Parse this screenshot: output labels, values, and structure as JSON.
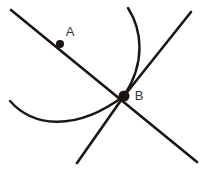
{
  "figure": {
    "title": "Intersecting lines and arcs at point B",
    "background_color": "#ffffff",
    "stroke_color": "#1a1512",
    "label_color": "#3a3532",
    "width": 204,
    "height": 170,
    "points": [
      {
        "id": "A",
        "label": "A",
        "x": 60,
        "y": 44,
        "label_x": 70,
        "label_y": 33,
        "radius": 4
      },
      {
        "id": "B",
        "label": "B",
        "x": 124,
        "y": 96,
        "label_x": 139,
        "label_y": 97,
        "radius": 5.5
      }
    ],
    "lines": [
      {
        "id": "line-ab-extended",
        "name": "line through A and B",
        "d": "M 11 10 L 197 162"
      },
      {
        "id": "line-b-upper-right",
        "name": "ray from B to upper right",
        "d": "M 124 96 L 191 12"
      },
      {
        "id": "line-b-lower-left",
        "name": "ray from B to lower left",
        "d": "M 124 96 L 77 163"
      }
    ],
    "arcs": [
      {
        "id": "arc-top",
        "name": "arc from top curving into B",
        "d": "M 128 8 C 142 30, 146 62, 124 96"
      },
      {
        "id": "arc-left",
        "name": "arc from left sweeping into B",
        "d": "M 10 101 C 32 126, 74 133, 124 96"
      }
    ]
  }
}
